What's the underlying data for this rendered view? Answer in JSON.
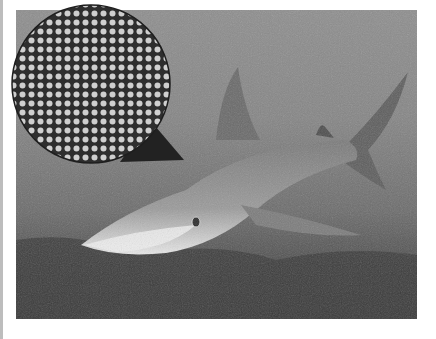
{
  "image": {
    "description": "Grayscale underwater photo of a reef shark swimming over a reef, with a circular magnified inset (upper-left) showing a halftone dot pattern",
    "subject": "shark",
    "inset": "halftone-dot-magnifier",
    "colors": {
      "water_top": "#8e8e8e",
      "water_bottom": "#3d3d3d",
      "shark_belly": "#e6e6e6",
      "inset_bg": "#2e2e2e",
      "inset_dot": "#cfcfcf"
    }
  }
}
